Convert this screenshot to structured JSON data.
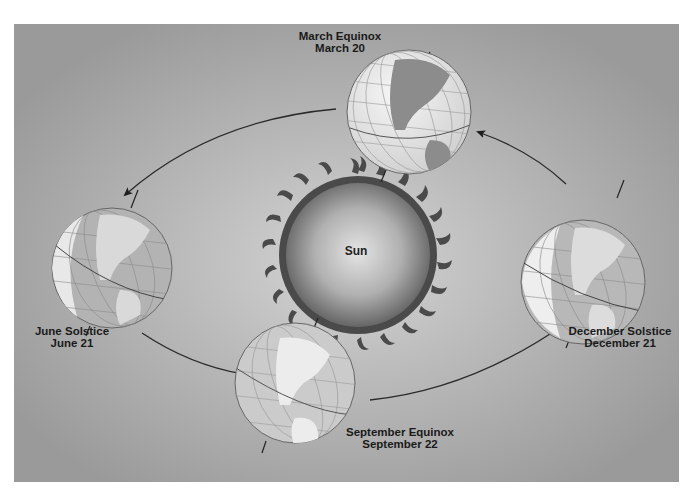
{
  "diagram": {
    "type": "earth-orbit-seasons",
    "center": {
      "label": "Sun"
    },
    "positions": [
      {
        "id": "march",
        "name": "March Equinox",
        "date": "March 20"
      },
      {
        "id": "june",
        "name": "June Solstice",
        "date": "June 21"
      },
      {
        "id": "september",
        "name": "September Equinox",
        "date": "September 22"
      },
      {
        "id": "december",
        "name": "December Solstice",
        "date": "December 21"
      }
    ],
    "orbit_direction": "counterclockwise"
  },
  "colors": {
    "background_light": "#d4d4d4",
    "background_dark": "#9a9a9a",
    "globe_day": "#efefef",
    "globe_night": "#a8a8a8",
    "land": "#8a8a8a",
    "sun_flame": "#4a4a4a",
    "arrow": "#2a2a2a"
  }
}
